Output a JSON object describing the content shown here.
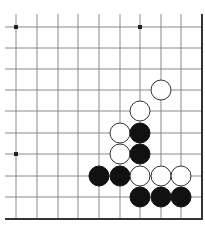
{
  "board": {
    "grid_x": [
      16,
      37,
      58,
      78,
      99,
      120,
      140,
      161,
      181
    ],
    "grid_y": [
      27,
      48,
      69,
      90,
      111,
      133,
      154,
      176,
      197
    ],
    "right_edge_x": 202,
    "bottom_edge_y": 219,
    "line_color": "#8a8a8a",
    "edge_color": "#333333",
    "star_points": [
      [
        0,
        0
      ],
      [
        6,
        0
      ],
      [
        0,
        6
      ]
    ],
    "stone_radius": 10,
    "stones": [
      {
        "color": "white",
        "col": 7,
        "row": 3
      },
      {
        "color": "white",
        "col": 6,
        "row": 4
      },
      {
        "color": "white",
        "col": 5,
        "row": 5
      },
      {
        "color": "black",
        "col": 6,
        "row": 5
      },
      {
        "color": "white",
        "col": 5,
        "row": 6
      },
      {
        "color": "black",
        "col": 6,
        "row": 6
      },
      {
        "color": "black",
        "col": 4,
        "row": 7
      },
      {
        "color": "black",
        "col": 5,
        "row": 7
      },
      {
        "color": "white",
        "col": 6,
        "row": 7
      },
      {
        "color": "white",
        "col": 7,
        "row": 7
      },
      {
        "color": "white",
        "col": 8,
        "row": 7
      },
      {
        "color": "black",
        "col": 6,
        "row": 8
      },
      {
        "color": "black",
        "col": 7,
        "row": 8
      },
      {
        "color": "black",
        "col": 8,
        "row": 8
      }
    ]
  }
}
